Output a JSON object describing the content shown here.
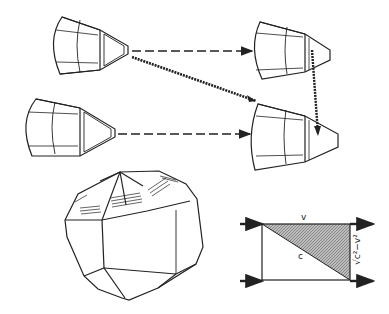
{
  "diagram": {
    "labels": {
      "top_edge": "v",
      "hypotenuse": "c",
      "vertical_edge": "√c²−v²"
    },
    "colors": {
      "ink": "#222222",
      "shade": "#9a9a9a",
      "background": "#ffffff"
    },
    "elements": [
      "capsule-top-left",
      "capsule-bottom-left",
      "capsule-top-right",
      "capsule-bottom-right",
      "dashed-arrow-top",
      "dashed-arrow-bottom",
      "diagonal-arrow",
      "vertical-arrow",
      "polyhedron",
      "velocity-triangle"
    ]
  }
}
